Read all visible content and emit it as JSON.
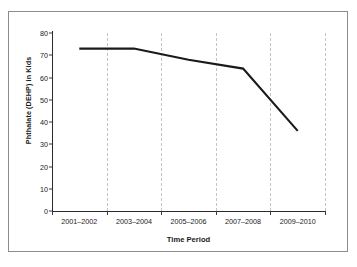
{
  "chart_data": {
    "type": "line",
    "title": "",
    "categories": [
      "2001–2002",
      "2003–2004",
      "2005–2006",
      "2007–2008",
      "2009–2010"
    ],
    "values": [
      73,
      73,
      68,
      64,
      36
    ],
    "xlabel": "Time Period",
    "ylabel": "Phthalate (DEHP) in Kids",
    "ylim": [
      0,
      80
    ],
    "ytick_labels": [
      "80",
      "70",
      "60",
      "50",
      "40",
      "30",
      "20",
      "10",
      "0"
    ],
    "ytick_values": [
      80,
      70,
      60,
      50,
      40,
      30,
      20,
      10,
      0
    ],
    "grid": "vertical-dashed",
    "legend": "none",
    "series_color": "#1a1a1a",
    "gridline_color": "#c3c3c3",
    "axis_color": "#2b2b2b",
    "frame_color": "#8c8c8c",
    "background": "#ffffff"
  }
}
